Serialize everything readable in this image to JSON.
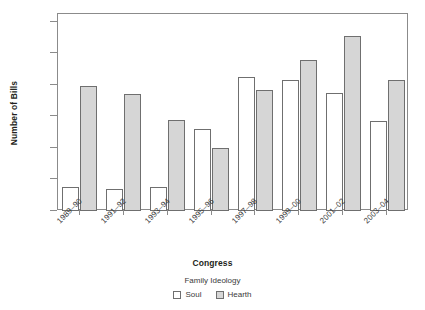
{
  "chart_data": {
    "type": "bar",
    "title": "",
    "xlabel": "Congress",
    "ylabel": "Number of Bills",
    "categories": [
      "1989–90",
      "1991–92",
      "1993–94",
      "1995–96",
      "1997–98",
      "1999–00",
      "2001–02",
      "2003–04"
    ],
    "series": [
      {
        "name": "Soul",
        "values": [
          15,
          14,
          15,
          52,
          85,
          83,
          75,
          57
        ],
        "color": "#ffffff"
      },
      {
        "name": "Hearth",
        "values": [
          79,
          74,
          58,
          40,
          77,
          96,
          111,
          83
        ],
        "color": "#d6d6d6"
      }
    ],
    "legend_title": "Family Ideology",
    "legend_position": "bottom",
    "ylim": [
      0,
      125
    ],
    "yticks": [
      0,
      20,
      40,
      60,
      80,
      100,
      120
    ],
    "ytick_labels": [
      "0",
      "20",
      "40",
      "60",
      "80",
      "100",
      "120"
    ],
    "grid": false,
    "axis_color": "#8b8b8b",
    "bar_edge_color": "#6f6f6f"
  }
}
